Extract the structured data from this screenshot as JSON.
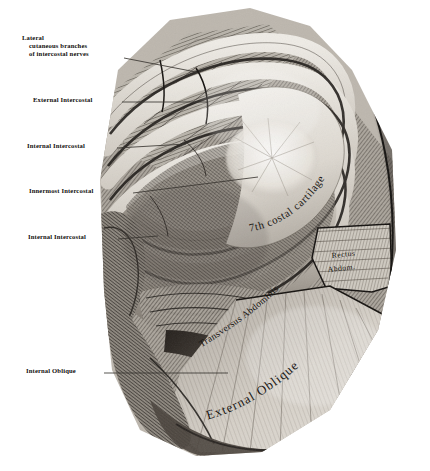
{
  "plate": {
    "title": "Intercostal muscles and abdominal wall dissection",
    "medium": "halftone anatomical engraving",
    "background_color": "#ffffff",
    "ink_color": "#12100e"
  },
  "labels": [
    {
      "id": "lateral-cutaneous-branches",
      "lines": [
        "Lateral",
        "cutaneous branches",
        "of intercostal nerves"
      ],
      "text": "Lateral cutaneous branches of intercostal nerves",
      "x": 22,
      "y": 36,
      "leader": {
        "x1": 124,
        "y1": 58,
        "x2": 196,
        "y2": 72
      }
    },
    {
      "id": "external-intercostal",
      "lines": [
        "External Intercostal"
      ],
      "text": "External Intercostal",
      "x": 33,
      "y": 99,
      "leader": {
        "x1": 122,
        "y1": 102,
        "x2": 208,
        "y2": 102
      }
    },
    {
      "id": "internal-intercostal-upper",
      "lines": [
        "Internal Intercostal"
      ],
      "text": "Internal Intercostal",
      "x": 27,
      "y": 145,
      "leader": {
        "x1": 117,
        "y1": 148,
        "x2": 186,
        "y2": 144
      }
    },
    {
      "id": "innermost-intercostal",
      "lines": [
        "Innermost Intercostal"
      ],
      "text": "Innermost Intercostal",
      "x": 29,
      "y": 190,
      "leader": {
        "x1": 133,
        "y1": 193,
        "x2": 258,
        "y2": 177
      }
    },
    {
      "id": "internal-intercostal-lower",
      "lines": [
        "Internal Intercostal"
      ],
      "text": "Internal Intercostal",
      "x": 28,
      "y": 236,
      "leader": {
        "x1": 118,
        "y1": 239,
        "x2": 158,
        "y2": 236
      }
    },
    {
      "id": "internal-oblique",
      "lines": [
        "Internal Oblique"
      ],
      "text": "Internal Oblique",
      "x": 26,
      "y": 370,
      "leader": {
        "x1": 104,
        "y1": 373,
        "x2": 228,
        "y2": 373
      }
    }
  ],
  "in_figure_text": [
    {
      "id": "seventh-costal-cartilage",
      "text": "7th costal cartilage",
      "style": "curved-serif",
      "size": 9.5
    },
    {
      "id": "transversus-abdominis",
      "text": "Transversus Abdominis",
      "style": "curved-serif",
      "size": 8.6
    },
    {
      "id": "rectus-abdominis",
      "text": "Rectus Abdom.",
      "lines": [
        "Rectus",
        "Abdom."
      ],
      "style": "serif",
      "size": 7.2
    },
    {
      "id": "external-oblique",
      "text": "External Oblique",
      "style": "curved-serif",
      "size": 12
    }
  ],
  "palette": {
    "paper": "#ffffff",
    "ink": "#12100e",
    "leader_line": "#3a3632",
    "muscle_mid": "#8b857c",
    "muscle_dark": "#2f2b27",
    "muscle_light": "#d8d3ca",
    "cartilage": "#e6e2da",
    "shadow": "#4a443d"
  }
}
